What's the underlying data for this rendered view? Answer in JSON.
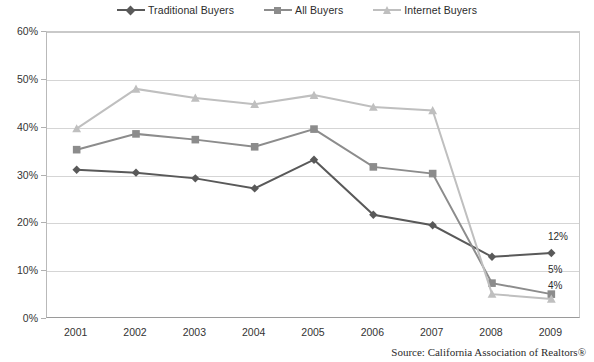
{
  "legend": {
    "position": "top-center",
    "items": [
      {
        "label": "Traditional Buyers",
        "marker": "diamond-marker",
        "color": "#595959"
      },
      {
        "label": "All Buyers",
        "marker": "square-marker",
        "color": "#8c8c8c"
      },
      {
        "label": "Internet Buyers",
        "marker": "triangle-marker",
        "color": "#bfbfbf"
      }
    ]
  },
  "axes": {
    "y_ticks": [
      "0%",
      "10%",
      "20%",
      "30%",
      "40%",
      "50%",
      "60%"
    ],
    "x_ticks": [
      "2001",
      "2002",
      "2003",
      "2004",
      "2005",
      "2006",
      "2007",
      "2008",
      "2009"
    ]
  },
  "end_labels": {
    "traditional": "12%",
    "all": "5%",
    "internet": "4%"
  },
  "source": "Source: California Association of Realtors®",
  "chart_data": {
    "type": "line",
    "title": "",
    "subtitle": "",
    "xlabel": "",
    "ylabel": "",
    "x": [
      "2001",
      "2002",
      "2003",
      "2004",
      "2005",
      "2006",
      "2007",
      "2008",
      "2009"
    ],
    "categories": [
      "2001",
      "2002",
      "2003",
      "2004",
      "2005",
      "2006",
      "2007",
      "2008",
      "2009"
    ],
    "ylim": [
      0,
      60
    ],
    "ytick_values": [
      0,
      10,
      20,
      30,
      40,
      50,
      60
    ],
    "ytick_format": "percent",
    "grid": "horizontal",
    "legend_position": "top-center",
    "series": [
      {
        "name": "Traditional Buyers",
        "marker": "diamond",
        "color": "#595959",
        "values": [
          31.2,
          30.6,
          29.4,
          27.3,
          33.3,
          21.8,
          19.6,
          13.0,
          13.8
        ],
        "end_annotation": "12%"
      },
      {
        "name": "All Buyers",
        "marker": "square",
        "color": "#8c8c8c",
        "values": [
          35.4,
          38.7,
          37.5,
          36.0,
          39.7,
          31.8,
          30.4,
          7.5,
          5.2
        ],
        "end_annotation": "5%"
      },
      {
        "name": "Internet Buyers",
        "marker": "triangle",
        "color": "#bfbfbf",
        "values": [
          39.8,
          48.1,
          46.2,
          44.9,
          46.8,
          44.3,
          43.6,
          5.2,
          4.2
        ],
        "end_annotation": "4%"
      }
    ]
  }
}
